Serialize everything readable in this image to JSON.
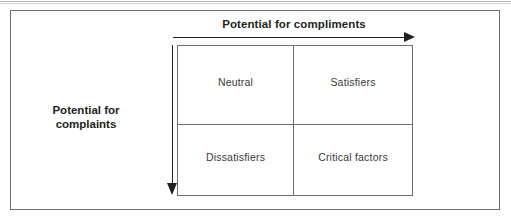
{
  "figure": {
    "type": "2x2-matrix-diagram",
    "axes": {
      "horizontal": {
        "label": "Potential for compliments",
        "direction": "right",
        "arrow_icon": "arrow-right-icon"
      },
      "vertical": {
        "label_line1": "Potential for",
        "label_line2": "complaints",
        "label_full": "Potential for complaints",
        "direction": "down",
        "arrow_icon": "arrow-down-icon"
      }
    },
    "quadrants": [
      {
        "position": "top-left",
        "label": "Neutral"
      },
      {
        "position": "top-right",
        "label": "Satisfiers"
      },
      {
        "position": "bottom-left",
        "label": "Dissatisfiers"
      },
      {
        "position": "bottom-right",
        "label": "Critical factors"
      }
    ],
    "colors": {
      "text": "#231f20",
      "quadrant_text": "#3a3a3c",
      "line": "#6e6e70",
      "arrow": "#231f20",
      "background": "#ffffff"
    }
  }
}
